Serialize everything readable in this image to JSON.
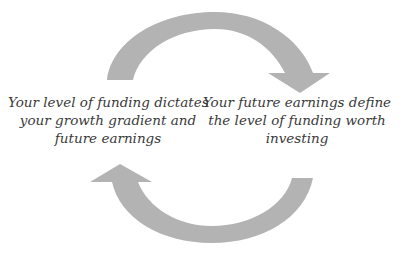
{
  "diagram": {
    "type": "cycle",
    "arrow_color": "#b3b3b3",
    "text_color": "#3a3a3a",
    "nodes": [
      {
        "id": "funding",
        "position": "left",
        "lines": [
          "Your level of funding dictates",
          "your growth gradient and",
          "future earnings"
        ]
      },
      {
        "id": "earnings",
        "position": "right",
        "lines": [
          "Your future earnings define",
          "the level of funding worth",
          "investing"
        ]
      }
    ],
    "arrows": [
      {
        "id": "top-arrow",
        "from": "funding",
        "to": "earnings",
        "direction": "clockwise-over-top"
      },
      {
        "id": "bottom-arrow",
        "from": "earnings",
        "to": "funding",
        "direction": "clockwise-under-bottom"
      }
    ]
  }
}
